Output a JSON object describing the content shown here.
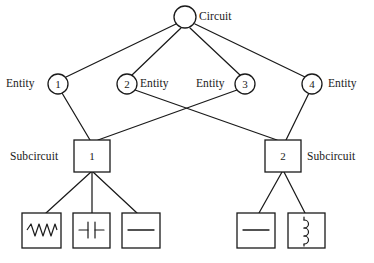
{
  "diagram": {
    "colors": {
      "stroke": "#1a1a1a",
      "fill": "#ffffff",
      "text": "#1a1a1a"
    },
    "root": {
      "label": "Circuit",
      "shape": "circle",
      "cx": 185,
      "cy": 17,
      "r": 11
    },
    "entities": [
      {
        "id": "entity-1",
        "number": "1",
        "label": "Entity",
        "label_side": "left",
        "cx": 58,
        "cy": 84,
        "r": 10
      },
      {
        "id": "entity-2",
        "number": "2",
        "label": "Entity",
        "label_side": "right",
        "cx": 127,
        "cy": 84,
        "r": 10
      },
      {
        "id": "entity-3",
        "number": "3",
        "label": "Entity",
        "label_side": "left",
        "cx": 245,
        "cy": 84,
        "r": 10
      },
      {
        "id": "entity-4",
        "number": "4",
        "label": "Entity",
        "label_side": "right",
        "cx": 312,
        "cy": 84,
        "r": 10
      }
    ],
    "subcircuits": [
      {
        "id": "subcircuit-1",
        "number": "1",
        "label": "Subcircuit",
        "label_side": "left",
        "x": 74,
        "y": 140,
        "w": 36,
        "h": 32
      },
      {
        "id": "subcircuit-2",
        "number": "2",
        "label": "Subcircuit",
        "label_side": "right",
        "x": 265,
        "y": 140,
        "w": 36,
        "h": 32
      }
    ],
    "components": [
      {
        "id": "component-resistor",
        "symbol": "resistor-icon",
        "x": 22,
        "y": 213,
        "w": 39,
        "h": 35
      },
      {
        "id": "component-capacitor",
        "symbol": "capacitor-icon",
        "x": 73,
        "y": 213,
        "w": 37,
        "h": 35
      },
      {
        "id": "component-wire-left",
        "symbol": "wire-icon",
        "x": 122,
        "y": 213,
        "w": 38,
        "h": 35
      },
      {
        "id": "component-wire-right",
        "symbol": "wire-icon",
        "x": 237,
        "y": 213,
        "w": 38,
        "h": 35
      },
      {
        "id": "component-inductor",
        "symbol": "inductor-icon",
        "x": 288,
        "y": 213,
        "w": 37,
        "h": 35
      }
    ],
    "edges": [
      {
        "from": "circuit",
        "to": "entity-1"
      },
      {
        "from": "circuit",
        "to": "entity-2"
      },
      {
        "from": "circuit",
        "to": "entity-3"
      },
      {
        "from": "circuit",
        "to": "entity-4"
      },
      {
        "from": "entity-1",
        "to": "subcircuit-1"
      },
      {
        "from": "entity-2",
        "to": "subcircuit-2"
      },
      {
        "from": "entity-3",
        "to": "subcircuit-1"
      },
      {
        "from": "entity-4",
        "to": "subcircuit-2"
      },
      {
        "from": "subcircuit-1",
        "to": "component-resistor"
      },
      {
        "from": "subcircuit-1",
        "to": "component-capacitor"
      },
      {
        "from": "subcircuit-1",
        "to": "component-wire-left"
      },
      {
        "from": "subcircuit-2",
        "to": "component-wire-right"
      },
      {
        "from": "subcircuit-2",
        "to": "component-inductor"
      }
    ]
  }
}
